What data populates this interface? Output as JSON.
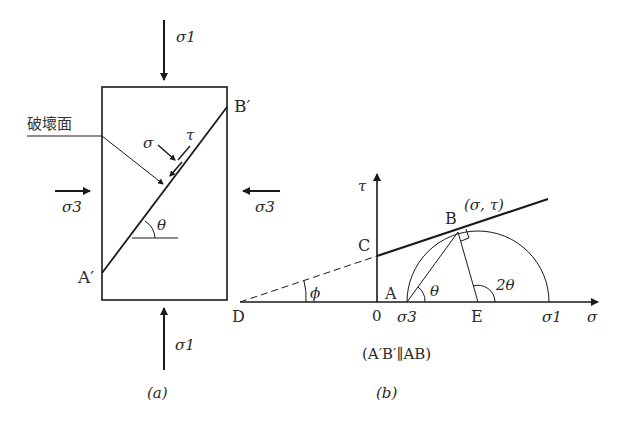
{
  "figure": {
    "panel_a": {
      "caption": "(a)",
      "failure_plane_label": "破壞面",
      "labels": {
        "sigma1_top": "σ1",
        "sigma1_bottom": "σ1",
        "sigma3_left": "σ3",
        "sigma3_right": "σ3",
        "normal_stress": "σ",
        "shear_stress": "τ",
        "angle": "θ",
        "point_a_prime": "A′",
        "point_b_prime": "B′"
      }
    },
    "panel_b": {
      "caption": "(b)",
      "note": "(A′B′∥AB)",
      "axes": {
        "x_label": "σ",
        "y_label": "τ",
        "origin": "0"
      },
      "points": {
        "A": "A",
        "B": "B",
        "C": "C",
        "D": "D",
        "E": "E",
        "B_coords": "(σ, τ)"
      },
      "tick_labels": {
        "sigma3": "σ3",
        "sigma1": "σ1"
      },
      "angles": {
        "theta": "θ",
        "two_theta": "2θ",
        "phi": "ϕ"
      }
    }
  }
}
